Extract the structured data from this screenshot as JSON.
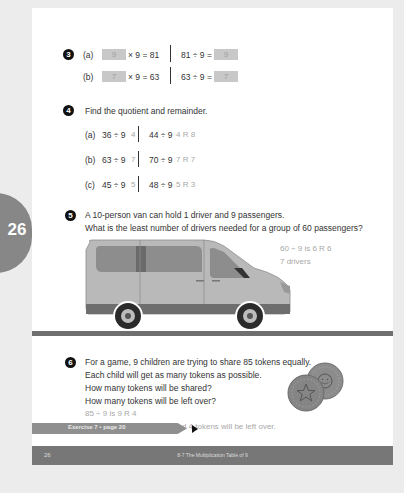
{
  "side_tab": {
    "page_number": "26"
  },
  "q3": {
    "number": "3",
    "rows": [
      {
        "label": "(a)",
        "box_left": "9",
        "left_rest": "× 9 = 81",
        "right_expr": "81 ÷ 9 =",
        "box_right": "9"
      },
      {
        "label": "(b)",
        "box_left": "7",
        "left_rest": "× 9 = 63",
        "right_expr": "63 ÷ 9 =",
        "box_right": "7"
      }
    ]
  },
  "q4": {
    "number": "4",
    "prompt": "Find the quotient and remainder.",
    "rows": [
      {
        "label": "(a)",
        "left_expr": "36 ÷ 9",
        "left_ans": "4",
        "right_expr": "44 ÷ 9",
        "right_ans": "4 R 8"
      },
      {
        "label": "(b)",
        "left_expr": "63 ÷ 9",
        "left_ans": "7",
        "right_expr": "70 ÷ 9",
        "right_ans": "7 R 7"
      },
      {
        "label": "(c)",
        "left_expr": "45 ÷ 9",
        "left_ans": "5",
        "right_expr": "48 ÷ 9",
        "right_ans": "5 R 3"
      }
    ]
  },
  "q5": {
    "number": "5",
    "lines": [
      "A 10-person van can hold 1 driver and 9 passengers.",
      "What is the least number of drivers needed for a group of 60 passengers?"
    ],
    "answers": [
      "60 ÷ 9 is 6 R 6",
      "7 drivers"
    ]
  },
  "q6": {
    "number": "6",
    "lines": [
      "For a game, 9 children are trying to share 85 tokens equally.",
      "Each child will get as many tokens as possible.",
      "How many tokens will be shared?",
      "How many tokens will be left over?"
    ],
    "answers": [
      "85 ÷ 9 is 9 R 4",
      "81 tokens will be shared and 4 tokens will be left over."
    ]
  },
  "exercise_tab": {
    "label": "Exercise 7 • page 20"
  },
  "footer": {
    "page": "26",
    "title": "8-7  The Multiplication Table of 9"
  },
  "colors": {
    "page_bg": "#ffffff",
    "outer_bg": "#ececec",
    "accent_gray": "#777777",
    "answer_gray": "#a8a8a8"
  }
}
